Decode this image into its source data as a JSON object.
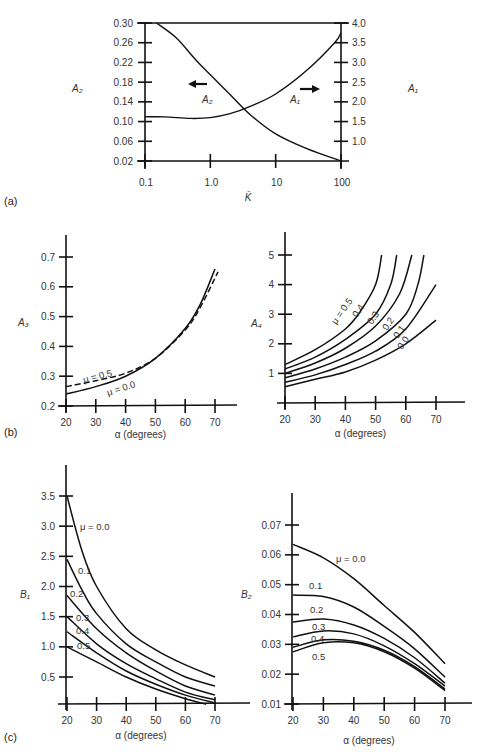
{
  "panel_labels": [
    "(a)",
    "(b)",
    "(c)"
  ],
  "chart_data": [
    {
      "id": "a",
      "type": "line",
      "panel": "(a)",
      "xlabel": "K̄",
      "xscale": "log",
      "xticks": [
        0.1,
        1.0,
        10,
        100
      ],
      "xtick_labels": [
        "0.1",
        "1.0",
        "10",
        "100"
      ],
      "ylabel_left": "A2",
      "ylim_left": [
        0.02,
        0.3
      ],
      "yticks_left": [
        "0.30",
        "0.26",
        "0.22",
        "0.18",
        "0.14",
        "0.10",
        "0.06",
        "0.02"
      ],
      "ylabel_right": "A1",
      "ylim_right": [
        0.5,
        4.0
      ],
      "yticks_right": [
        "4.0",
        "3.5",
        "3.0",
        "2.5",
        "2.0",
        "1.5",
        "1.0"
      ],
      "series": [
        {
          "name": "A2",
          "axis": "left",
          "arrow": "left",
          "x": [
            0.15,
            0.3,
            0.6,
            1.0,
            2.0,
            4.0,
            10,
            30,
            100
          ],
          "y": [
            0.3,
            0.27,
            0.225,
            0.195,
            0.155,
            0.115,
            0.075,
            0.045,
            0.02
          ]
        },
        {
          "name": "A1",
          "axis": "right",
          "arrow": "right",
          "x": [
            0.1,
            0.2,
            0.5,
            1.0,
            2.0,
            4.0,
            10,
            30,
            80,
            100
          ],
          "y": [
            1.62,
            1.62,
            1.58,
            1.6,
            1.7,
            1.88,
            2.2,
            2.8,
            3.5,
            3.75
          ]
        }
      ]
    },
    {
      "id": "b-left",
      "type": "line",
      "panel": "(b)",
      "xlabel": "α (degrees)",
      "xticks": [
        20,
        30,
        40,
        50,
        60,
        70
      ],
      "ylabel": "A3",
      "ylim": [
        0.2,
        0.7
      ],
      "yticks": [
        "0.7",
        "0.6",
        "0.5",
        "0.4",
        "0.3",
        "0.2"
      ],
      "series": [
        {
          "name": "μ = 0.0",
          "style": "solid",
          "x": [
            20,
            30,
            40,
            50,
            60,
            65,
            70
          ],
          "y": [
            0.24,
            0.265,
            0.3,
            0.36,
            0.46,
            0.54,
            0.66
          ]
        },
        {
          "name": "μ = 0.5",
          "style": "dashed",
          "x": [
            20,
            30,
            40,
            50,
            60,
            65,
            71
          ],
          "y": [
            0.265,
            0.285,
            0.31,
            0.36,
            0.455,
            0.53,
            0.65
          ]
        }
      ]
    },
    {
      "id": "b-right",
      "type": "line",
      "panel": "(b)",
      "xlabel": "α (degrees)",
      "xticks": [
        20,
        30,
        40,
        50,
        60,
        70
      ],
      "ylabel": "A4",
      "ylim": [
        0,
        5
      ],
      "yticks": [
        "5",
        "4",
        "3",
        "2",
        "1"
      ],
      "series": [
        {
          "name": "μ = 0.5",
          "label": "μ = 0.5",
          "x": [
            20,
            30,
            40,
            45,
            50,
            52
          ],
          "y": [
            1.3,
            1.8,
            2.5,
            3.1,
            4.0,
            5.0
          ]
        },
        {
          "name": "μ = 0.4",
          "label": "0.4",
          "x": [
            20,
            30,
            40,
            50,
            55,
            57
          ],
          "y": [
            1.15,
            1.55,
            2.15,
            3.0,
            4.0,
            5.0
          ]
        },
        {
          "name": "μ = 0.3",
          "label": "0.3",
          "x": [
            20,
            30,
            40,
            50,
            58,
            62
          ],
          "y": [
            1.0,
            1.35,
            1.85,
            2.6,
            3.7,
            5.0
          ]
        },
        {
          "name": "μ = 0.2",
          "label": "0.2",
          "x": [
            20,
            30,
            40,
            50,
            60,
            64,
            66
          ],
          "y": [
            0.85,
            1.15,
            1.55,
            2.1,
            3.0,
            4.0,
            5.0
          ]
        },
        {
          "name": "μ = 0.1",
          "label": "0.1",
          "x": [
            20,
            30,
            40,
            50,
            60,
            70
          ],
          "y": [
            0.7,
            0.95,
            1.3,
            1.75,
            2.5,
            4.0
          ]
        },
        {
          "name": "μ = 0.0",
          "label": "0.0",
          "x": [
            20,
            30,
            40,
            50,
            60,
            70
          ],
          "y": [
            0.55,
            0.8,
            1.05,
            1.45,
            2.0,
            2.8
          ]
        }
      ]
    },
    {
      "id": "c-left",
      "type": "line",
      "panel": "(c)",
      "xlabel": "α (degrees)",
      "xticks": [
        20,
        30,
        40,
        50,
        60,
        70
      ],
      "ylabel": "B1",
      "ylim": [
        0.05,
        3.5
      ],
      "yticks": [
        "3.5",
        "3.0",
        "2.5",
        "2.0",
        "1.5",
        "1.0",
        "0.5"
      ],
      "series": [
        {
          "name": "μ = 0.0",
          "label": "μ = 0.0",
          "x": [
            20,
            25,
            30,
            40,
            50,
            60,
            70
          ],
          "y": [
            3.5,
            2.6,
            2.0,
            1.3,
            0.95,
            0.7,
            0.5
          ]
        },
        {
          "name": "μ = 0.1",
          "label": "0.1",
          "x": [
            20,
            25,
            30,
            40,
            50,
            60,
            70
          ],
          "y": [
            2.45,
            1.95,
            1.55,
            1.05,
            0.75,
            0.5,
            0.35
          ]
        },
        {
          "name": "μ = 0.2",
          "label": "0.2",
          "x": [
            20,
            30,
            40,
            50,
            60,
            70
          ],
          "y": [
            1.85,
            1.3,
            0.9,
            0.6,
            0.35,
            0.2
          ]
        },
        {
          "name": "μ = 0.3",
          "label": "0.3",
          "x": [
            20,
            30,
            40,
            50,
            60,
            70
          ],
          "y": [
            1.5,
            1.05,
            0.72,
            0.47,
            0.25,
            0.12
          ]
        },
        {
          "name": "μ = 0.4",
          "label": "0.4",
          "x": [
            20,
            30,
            40,
            50,
            60,
            70
          ],
          "y": [
            1.25,
            0.9,
            0.6,
            0.38,
            0.2,
            0.07
          ]
        },
        {
          "name": "μ = 0.5",
          "label": "0.5",
          "x": [
            20,
            30,
            40,
            50,
            60,
            67
          ],
          "y": [
            1.0,
            0.75,
            0.5,
            0.3,
            0.14,
            0.05
          ]
        }
      ]
    },
    {
      "id": "c-right",
      "type": "line",
      "panel": "(c)",
      "xlabel": "α (degrees)",
      "xticks": [
        20,
        30,
        40,
        50,
        60,
        70
      ],
      "ylabel": "B2",
      "ylim": [
        0.01,
        0.07
      ],
      "yticks": [
        "0.07",
        "0.06",
        "0.05",
        "0.04",
        "0.03",
        "0.02",
        "0.01"
      ],
      "series": [
        {
          "name": "μ = 0.0",
          "label": "μ = 0.0",
          "x": [
            20,
            30,
            40,
            50,
            60,
            70
          ],
          "y": [
            0.0635,
            0.059,
            0.052,
            0.043,
            0.034,
            0.0235
          ]
        },
        {
          "name": "μ = 0.1",
          "label": "0.1",
          "x": [
            20,
            30,
            40,
            50,
            60,
            70
          ],
          "y": [
            0.0465,
            0.046,
            0.0425,
            0.036,
            0.0285,
            0.019
          ]
        },
        {
          "name": "μ = 0.2",
          "label": "0.2",
          "x": [
            20,
            30,
            40,
            50,
            60,
            70
          ],
          "y": [
            0.0375,
            0.0385,
            0.0365,
            0.032,
            0.0255,
            0.017
          ]
        },
        {
          "name": "μ = 0.3",
          "label": "0.3",
          "x": [
            20,
            30,
            40,
            50,
            60,
            70
          ],
          "y": [
            0.0325,
            0.0345,
            0.0335,
            0.0295,
            0.0235,
            0.016
          ]
        },
        {
          "name": "μ = 0.4",
          "label": "0.4",
          "x": [
            20,
            30,
            40,
            50,
            60,
            70
          ],
          "y": [
            0.029,
            0.0315,
            0.031,
            0.028,
            0.0225,
            0.015
          ]
        },
        {
          "name": "μ = 0.5",
          "label": "0.5",
          "x": [
            20,
            30,
            40,
            50,
            60,
            70
          ],
          "y": [
            0.0275,
            0.0305,
            0.0305,
            0.0275,
            0.022,
            0.0145
          ]
        }
      ]
    }
  ]
}
